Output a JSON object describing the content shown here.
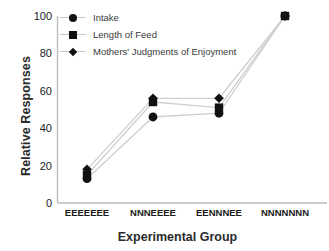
{
  "chart_data": {
    "type": "line",
    "title": "",
    "xlabel": "Experimental Group",
    "ylabel": "Relative Responses",
    "categories": [
      "EEEEEEE",
      "NNNEEEE",
      "EENNNEE",
      "NNNNNNN"
    ],
    "ylim": [
      0,
      100
    ],
    "yticks": [
      0,
      20,
      40,
      60,
      80,
      100
    ],
    "grid": false,
    "legend_position": "top-left",
    "series": [
      {
        "name": "Intake",
        "marker": "circle",
        "values": [
          13,
          46,
          48,
          100
        ]
      },
      {
        "name": "Length of Feed",
        "marker": "square",
        "values": [
          15,
          54,
          51,
          100
        ]
      },
      {
        "name": "Mothers' Judgments of Enjoyment",
        "marker": "diamond",
        "values": [
          18,
          56,
          56,
          100
        ]
      }
    ],
    "colors": {
      "marker": "#111111",
      "line": "#cccccc",
      "axis": "#b8b8b8",
      "text": "#1a1a1a"
    }
  }
}
